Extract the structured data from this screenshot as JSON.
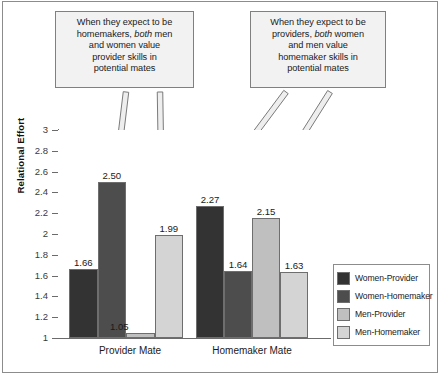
{
  "callouts": {
    "left": {
      "line1": "When they expect to be",
      "line2_a": "homemakers, ",
      "line2_em": "both",
      "line2_b": " men",
      "line3": "and women value",
      "line4": "provider skills in",
      "line5": "potential mates",
      "full_text": "When they expect to be homemakers, both men and women value provider skills in potential mates"
    },
    "right": {
      "line1": "When they expect to be",
      "line2_a": "providers, ",
      "line2_em": "both",
      "line2_b": " women",
      "line3": "and men value",
      "line4": "homemaker skills in",
      "line5": "potential mates",
      "full_text": "When they expect to be providers, both women and men value homemaker skills in potential mates"
    }
  },
  "chart_data": {
    "type": "bar",
    "title": "",
    "xlabel": "",
    "ylabel": "Relational Effort",
    "ylim": [
      1,
      3
    ],
    "ytick_labels": [
      "3",
      "2.8",
      "2.6",
      "2.4",
      "2.2",
      "2",
      "1.8",
      "1.6",
      "1.4",
      "1.2",
      "1"
    ],
    "ytick_values": [
      3,
      2.8,
      2.6,
      2.4,
      2.2,
      2,
      1.8,
      1.6,
      1.4,
      1.2,
      1
    ],
    "grid": false,
    "legend_position": "right-inside",
    "categories": [
      "Provider Mate",
      "Homemaker Mate"
    ],
    "series": [
      {
        "name": "Women-Provider",
        "color": "#333333",
        "values": [
          1.66,
          2.27
        ],
        "labels": [
          "1.66",
          "2.27"
        ]
      },
      {
        "name": "Women-Homemaker",
        "color": "#4d4d4d",
        "values": [
          2.5,
          1.64
        ],
        "labels": [
          "2.50",
          "1.64"
        ]
      },
      {
        "name": "Men-Provider",
        "color": "#bfbfbf",
        "values": [
          1.05,
          2.15
        ],
        "labels": [
          "1.05",
          "2.15"
        ]
      },
      {
        "name": "Men-Homemaker",
        "color": "#d4d4d4",
        "values": [
          1.99,
          1.63
        ],
        "labels": [
          "1.99",
          "1.63"
        ]
      }
    ]
  },
  "legend": {
    "items": [
      {
        "label": "Women-Provider",
        "color": "#333333"
      },
      {
        "label": "Women-Homemaker",
        "color": "#4d4d4d"
      },
      {
        "label": "Men-Provider",
        "color": "#bfbfbf"
      },
      {
        "label": "Men-Homemaker",
        "color": "#d4d4d4"
      }
    ]
  },
  "annotations": {
    "arrows": [
      {
        "name": "arrow-left-to-women-homemaker",
        "from": [
          126,
          92
        ],
        "to": [
          118,
          158
        ]
      },
      {
        "name": "arrow-left-to-men-homemaker",
        "from": [
          160,
          92
        ],
        "to": [
          162,
          218
        ]
      },
      {
        "name": "arrow-right-to-women-provider",
        "from": [
          286,
          92
        ],
        "to": [
          216,
          186
        ]
      },
      {
        "name": "arrow-right-to-men-provider",
        "from": [
          330,
          92
        ],
        "to": [
          262,
          200
        ]
      }
    ]
  },
  "colors": {
    "frame": "#8c8c8c",
    "axis": "#6b6b6b",
    "callout_fill": "#f2f2f2",
    "callout_border": "#808080",
    "arrow_fill": "#eeeeee",
    "arrow_stroke": "#777777",
    "text": "#1a1a1a"
  }
}
